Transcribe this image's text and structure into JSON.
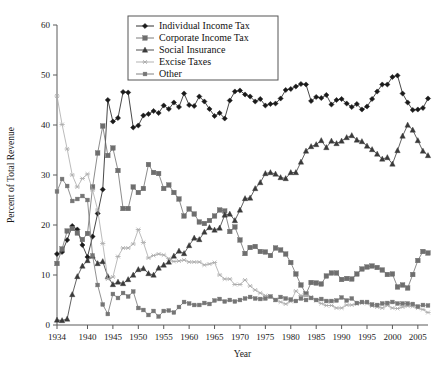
{
  "chart_data": {
    "type": "line",
    "title": "",
    "xlabel": "Year",
    "ylabel": "Percent of Total Revenue",
    "xlim": [
      1934,
      2007
    ],
    "ylim": [
      0,
      60
    ],
    "xticks": [
      1934,
      1940,
      1945,
      1950,
      1955,
      1960,
      1965,
      1970,
      1975,
      1980,
      1985,
      1990,
      1995,
      2000,
      2005
    ],
    "yticks": [
      0,
      10,
      20,
      30,
      40,
      50,
      60
    ],
    "grid": false,
    "legend_position": "top-center",
    "x": [
      1934,
      1935,
      1936,
      1937,
      1938,
      1939,
      1940,
      1941,
      1942,
      1943,
      1944,
      1945,
      1946,
      1947,
      1948,
      1949,
      1950,
      1951,
      1952,
      1953,
      1954,
      1955,
      1956,
      1957,
      1958,
      1959,
      1960,
      1961,
      1962,
      1963,
      1964,
      1965,
      1966,
      1967,
      1968,
      1969,
      1970,
      1971,
      1972,
      1973,
      1974,
      1975,
      1976,
      1977,
      1978,
      1979,
      1980,
      1981,
      1982,
      1983,
      1984,
      1985,
      1986,
      1987,
      1988,
      1989,
      1990,
      1991,
      1992,
      1993,
      1994,
      1995,
      1996,
      1997,
      1998,
      1999,
      2000,
      2001,
      2002,
      2003,
      2004,
      2005,
      2006,
      2007
    ],
    "series": [
      {
        "name": "Individual Income Tax",
        "marker": "diamond",
        "color": "#1a1a1a",
        "values": [
          14.2,
          14.6,
          17.0,
          19.8,
          19.1,
          16.0,
          13.6,
          17.7,
          22.3,
          27.1,
          45.0,
          40.7,
          41.4,
          46.6,
          46.5,
          39.5,
          39.9,
          41.9,
          42.2,
          42.8,
          42.4,
          43.9,
          43.2,
          44.5,
          43.6,
          46.3,
          44.0,
          43.8,
          45.7,
          44.7,
          43.2,
          41.8,
          42.4,
          41.3,
          44.9,
          46.7,
          46.9,
          46.1,
          45.7,
          44.7,
          45.2,
          43.9,
          44.2,
          44.3,
          45.3,
          47.0,
          47.2,
          47.7,
          48.2,
          48.1,
          44.8,
          45.6,
          45.4,
          46.0,
          44.1,
          45.0,
          45.2,
          44.3,
          43.6,
          44.2,
          43.1,
          43.7,
          45.2,
          46.7,
          48.1,
          48.1,
          49.6,
          49.9,
          46.3,
          44.5,
          43.0,
          43.1,
          43.4,
          45.3
        ]
      },
      {
        "name": "Corporate Income Tax",
        "marker": "square",
        "color": "#6e6e6e",
        "values": [
          12.3,
          15.2,
          18.8,
          19.3,
          18.4,
          17.1,
          18.3,
          27.6,
          34.4,
          39.8,
          33.9,
          35.4,
          30.9,
          23.3,
          23.3,
          27.6,
          26.5,
          27.3,
          32.1,
          30.5,
          30.3,
          27.3,
          28.0,
          26.5,
          25.2,
          21.8,
          23.2,
          22.2,
          20.6,
          20.3,
          20.9,
          21.8,
          23.0,
          22.8,
          18.7,
          19.6,
          17.0,
          14.3,
          15.5,
          15.7,
          14.7,
          14.6,
          13.9,
          15.4,
          15.0,
          14.2,
          12.5,
          10.2,
          8.0,
          6.2,
          8.5,
          8.4,
          8.2,
          9.8,
          10.4,
          10.4,
          9.1,
          9.3,
          9.2,
          10.2,
          11.2,
          11.6,
          11.8,
          11.5,
          11.0,
          10.1,
          10.2,
          7.6,
          8.0,
          7.4,
          10.1,
          12.9,
          14.7,
          14.4
        ]
      },
      {
        "name": "Social Insurance",
        "marker": "triangle",
        "color": "#3a3a3a",
        "values": [
          1.0,
          0.9,
          1.2,
          6.1,
          9.7,
          11.8,
          12.9,
          13.8,
          12.3,
          12.7,
          9.7,
          8.1,
          8.6,
          8.3,
          9.1,
          10.0,
          11.1,
          11.3,
          10.3,
          10.0,
          11.4,
          12.0,
          12.6,
          13.8,
          14.8,
          14.3,
          15.9,
          17.4,
          17.1,
          18.6,
          19.5,
          19.0,
          19.4,
          22.0,
          22.2,
          20.9,
          23.0,
          25.3,
          25.4,
          27.3,
          28.5,
          30.3,
          30.5,
          30.2,
          29.5,
          29.3,
          30.5,
          30.5,
          32.6,
          34.8,
          35.7,
          36.1,
          36.9,
          35.5,
          36.8,
          36.3,
          36.8,
          37.5,
          37.9,
          37.0,
          36.7,
          35.8,
          35.1,
          34.2,
          33.2,
          33.5,
          32.2,
          34.9,
          37.8,
          40.0,
          39.0,
          36.9,
          34.8,
          33.9
        ]
      },
      {
        "name": "Excise Taxes",
        "marker": "star",
        "color": "#aaaaaa",
        "values": [
          45.8,
          40.1,
          35.2,
          30.0,
          27.6,
          29.3,
          30.2,
          27.0,
          23.0,
          16.3,
          9.2,
          9.6,
          13.7,
          15.4,
          15.4,
          16.2,
          19.1,
          16.5,
          13.4,
          13.9,
          14.2,
          14.0,
          13.3,
          12.7,
          12.8,
          13.0,
          12.6,
          12.6,
          12.6,
          12.0,
          12.2,
          12.5,
          10.0,
          9.2,
          9.2,
          8.1,
          8.1,
          9.0,
          7.8,
          7.0,
          6.4,
          5.9,
          5.7,
          5.1,
          4.6,
          4.2,
          4.7,
          6.8,
          5.9,
          5.9,
          5.6,
          4.9,
          4.3,
          3.9,
          3.9,
          3.4,
          3.4,
          4.0,
          4.0,
          4.2,
          4.4,
          4.3,
          3.8,
          3.6,
          3.4,
          3.9,
          3.4,
          3.3,
          3.6,
          3.8,
          3.7,
          3.4,
          3.1,
          2.5
        ]
      },
      {
        "name": "Other",
        "marker": "square-small",
        "color": "#757575",
        "values": [
          26.7,
          29.2,
          27.8,
          24.8,
          25.2,
          25.8,
          25.0,
          13.9,
          8.0,
          4.1,
          2.2,
          6.2,
          5.4,
          6.4,
          5.7,
          6.7,
          3.4,
          3.0,
          2.0,
          2.8,
          1.7,
          2.8,
          2.9,
          2.5,
          3.6,
          4.6,
          4.3,
          4.0,
          4.0,
          4.4,
          4.2,
          4.9,
          5.2,
          4.7,
          5.0,
          4.7,
          5.0,
          5.3,
          5.6,
          5.3,
          5.2,
          5.3,
          5.7,
          5.0,
          5.6,
          5.3,
          5.1,
          4.8,
          5.3,
          5.0,
          5.4,
          5.0,
          5.2,
          4.8,
          4.8,
          4.9,
          5.5,
          4.9,
          5.3,
          4.4,
          4.6,
          4.6,
          4.1,
          4.0,
          4.3,
          4.4,
          4.6,
          4.3,
          4.3,
          4.3,
          4.2,
          3.7,
          4.0,
          3.9
        ]
      }
    ]
  },
  "legend": {
    "items": [
      {
        "label": "Individual Income Tax"
      },
      {
        "label": "Corporate Income Tax"
      },
      {
        "label": "Social Insurance"
      },
      {
        "label": "Excise Taxes"
      },
      {
        "label": "Other"
      }
    ]
  }
}
